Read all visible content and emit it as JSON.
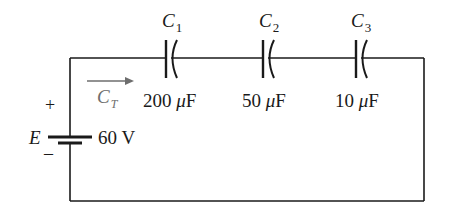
{
  "diagram": {
    "type": "series capacitor circuit",
    "colors": {
      "wire": "#1a1a1a",
      "text": "#1a1a1a",
      "arrow": "#6e6e6e",
      "background": "#ffffff"
    },
    "source": {
      "symbol": "E",
      "value": "60 V",
      "plus": "+",
      "minus": "–"
    },
    "current_arrow": {
      "label_main": "C",
      "label_sub": "T"
    },
    "capacitors": [
      {
        "name_main": "C",
        "name_sub": "1",
        "value_num": "200",
        "value_unit_mu": "μ",
        "value_unit": "F"
      },
      {
        "name_main": "C",
        "name_sub": "2",
        "value_num": "50",
        "value_unit_mu": "μ",
        "value_unit": "F"
      },
      {
        "name_main": "C",
        "name_sub": "3",
        "value_num": "10",
        "value_unit_mu": "μ",
        "value_unit": "F"
      }
    ]
  }
}
